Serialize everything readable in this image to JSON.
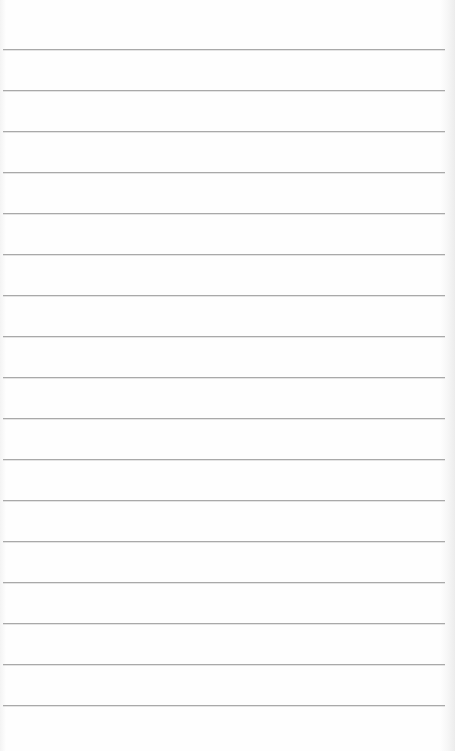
{
  "paper": {
    "type": "lined-paper",
    "line_color": "#a9a9a9",
    "background_color": "#fefefe",
    "first_line_y": 49,
    "line_spacing": 41,
    "line_count": 17,
    "line_left": 3,
    "line_width": 442
  }
}
